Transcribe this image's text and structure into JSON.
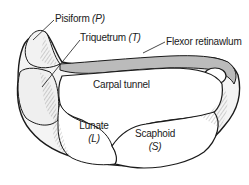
{
  "diagram": {
    "type": "anatomical cross-section",
    "labels": {
      "pisiform": {
        "name": "Pisiform",
        "abbr": "(P)"
      },
      "triquetrum": {
        "name": "Triquetrum",
        "abbr": "(T)"
      },
      "flexor_retinaculum": {
        "name": "Flexor retinawlum"
      },
      "carpal_tunnel": {
        "name": "Carpal tunnel"
      },
      "lunate": {
        "name": "Lunate",
        "abbr": "(L)"
      },
      "scaphoid": {
        "name": "Scaphoid",
        "abbr": "(S)"
      }
    },
    "colors": {
      "outline": "#1a1a1a",
      "bone_fill": "#f4f4f4",
      "hatch": "#555555",
      "background": "#ffffff"
    }
  }
}
